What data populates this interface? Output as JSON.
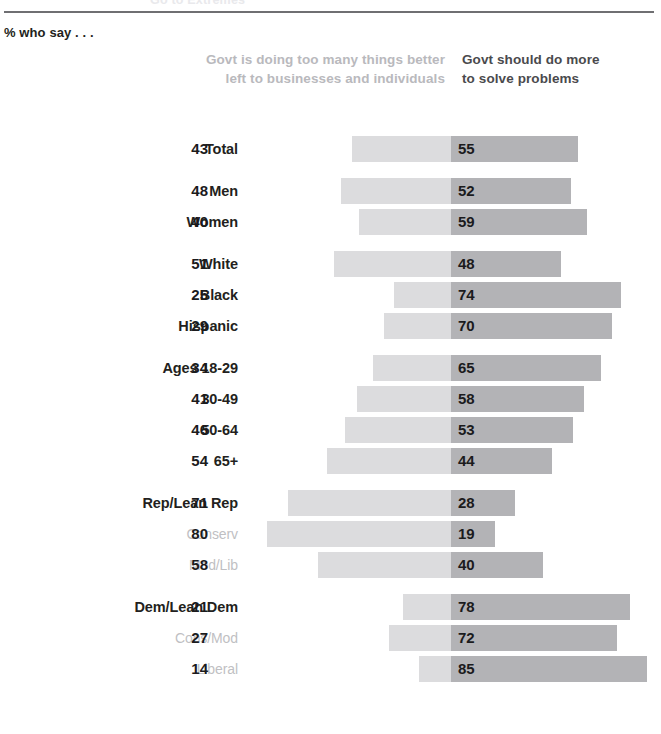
{
  "header": {
    "clipped_title": "Go to Extremes",
    "subtitle": "% who say . . .",
    "left_column_label": "Govt is doing too many things better left to businesses and individuals",
    "right_column_label": "Govt should do more to solve problems"
  },
  "colors": {
    "left_bar": "#dcdcde",
    "right_bar": "#b3b3b6",
    "label_dark": "#231f20",
    "label_gray": "#bfbfc3",
    "header_gray": "#b9b9bd",
    "header_dark": "#4a4a4d",
    "rule": "#6f6f72"
  },
  "chart_data": {
    "type": "bar",
    "orientation": "horizontal-diverging",
    "title": "Go to Extremes",
    "subtitle": "% who say . . .",
    "xlabel": "",
    "ylabel": "",
    "grid": false,
    "legend_position": "top",
    "px_per_unit": 2.3,
    "divider_x": 451,
    "series": [
      {
        "name": "Govt is doing too many things better left to businesses and individuals",
        "side": "left",
        "color": "#dcdcde",
        "values": [
          43,
          48,
          40,
          51,
          25,
          29,
          34,
          41,
          46,
          54,
          71,
          80,
          58,
          21,
          27,
          14
        ]
      },
      {
        "name": "Govt should do more to solve problems",
        "side": "right",
        "color": "#b3b3b6",
        "values": [
          55,
          52,
          59,
          48,
          74,
          70,
          65,
          58,
          53,
          44,
          28,
          19,
          40,
          78,
          72,
          85
        ]
      }
    ],
    "categories": [
      "Total",
      "Men",
      "Women",
      "White",
      "Black",
      "Hispanic",
      "Ages 18-29",
      "30-49",
      "50-64",
      "65+",
      "Rep/Lean Rep",
      "Conserv",
      "Mod/Lib",
      "Dem/Lean Dem",
      "Cons/Mod",
      "Liberal"
    ]
  },
  "rows": [
    {
      "label": "Total",
      "left": 43,
      "right": 55,
      "sub": false,
      "group_start": false
    },
    {
      "label": "Men",
      "left": 48,
      "right": 52,
      "sub": false,
      "group_start": true
    },
    {
      "label": "Women",
      "left": 40,
      "right": 59,
      "sub": false,
      "group_start": false
    },
    {
      "label": "White",
      "left": 51,
      "right": 48,
      "sub": false,
      "group_start": true
    },
    {
      "label": "Black",
      "left": 25,
      "right": 74,
      "sub": false,
      "group_start": false
    },
    {
      "label": "Hispanic",
      "left": 29,
      "right": 70,
      "sub": false,
      "group_start": false
    },
    {
      "label": "Ages 18-29",
      "left": 34,
      "right": 65,
      "sub": false,
      "group_start": true
    },
    {
      "label": "30-49",
      "left": 41,
      "right": 58,
      "sub": false,
      "group_start": false
    },
    {
      "label": "50-64",
      "left": 46,
      "right": 53,
      "sub": false,
      "group_start": false
    },
    {
      "label": "65+",
      "left": 54,
      "right": 44,
      "sub": false,
      "group_start": false
    },
    {
      "label": "Rep/Lean Rep",
      "left": 71,
      "right": 28,
      "sub": false,
      "group_start": true
    },
    {
      "label": "Conserv",
      "left": 80,
      "right": 19,
      "sub": true,
      "group_start": false
    },
    {
      "label": "Mod/Lib",
      "left": 58,
      "right": 40,
      "sub": true,
      "group_start": false
    },
    {
      "label": "Dem/Lean Dem",
      "left": 21,
      "right": 78,
      "sub": false,
      "group_start": true
    },
    {
      "label": "Cons/Mod",
      "left": 27,
      "right": 72,
      "sub": true,
      "group_start": false
    },
    {
      "label": "Liberal",
      "left": 14,
      "right": 85,
      "sub": true,
      "group_start": false
    }
  ]
}
